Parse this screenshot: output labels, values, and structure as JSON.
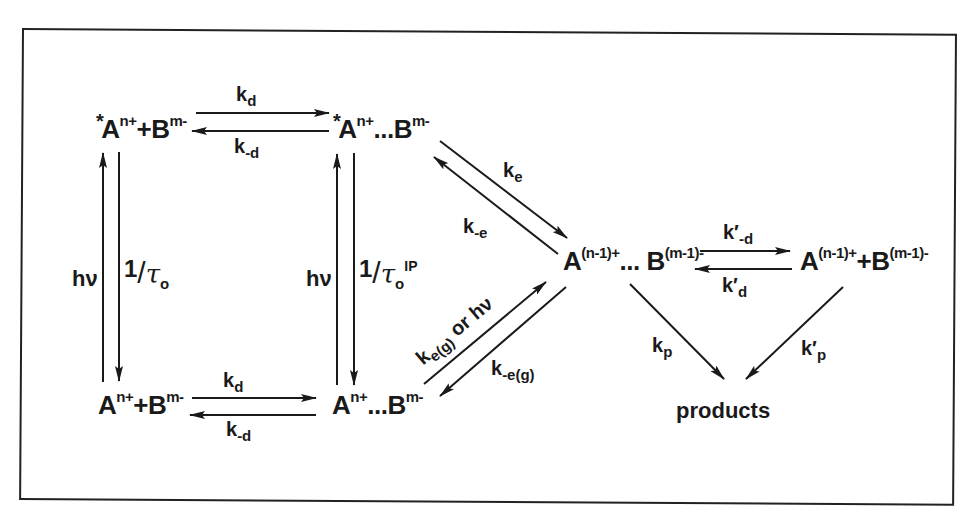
{
  "diagram": {
    "type": "reaction-scheme",
    "species": {
      "excited_free": {
        "star": "*",
        "a": "A",
        "a_charge": "n+",
        "join": "+",
        "b": "B",
        "b_charge": "m-"
      },
      "excited_pair": {
        "star": "*",
        "a": "A",
        "a_charge": "n+",
        "join": "...",
        "b": "B",
        "b_charge": "m-"
      },
      "ground_free": {
        "a": "A",
        "a_charge": "n+",
        "join": "+",
        "b": "B",
        "b_charge": "m-"
      },
      "ground_pair": {
        "a": "A",
        "a_charge": "n+",
        "join": "...",
        "b": "B",
        "b_charge": "m-"
      },
      "et_pair": {
        "a": "A",
        "a_charge": "(n-1)+",
        "join": "...",
        "b": "B",
        "b_charge": "(m-1)-"
      },
      "et_free": {
        "a": "A",
        "a_charge": "(n-1)+",
        "join": "+",
        "b": "B",
        "b_charge": "(m-1)-"
      },
      "products": "products"
    },
    "rate_labels": {
      "kd_top": {
        "k": "k",
        "sub": "d"
      },
      "k_minus_d_top": {
        "k": "k",
        "sub": "-d"
      },
      "kd_bottom": {
        "k": "k",
        "sub": "d"
      },
      "k_minus_d_bottom": {
        "k": "k",
        "sub": "-d"
      },
      "hv_left": "hν",
      "tau_left": {
        "one": "1",
        "slash": "/",
        "tau": "τ",
        "sub": "o",
        "sup": ""
      },
      "hv_middle": "hν",
      "tau_middle": {
        "one": "1",
        "slash": "/",
        "tau": "τ",
        "sub": "o",
        "sup": "IP"
      },
      "ke": {
        "k": "k",
        "sub": "e"
      },
      "k_minus_e": {
        "k": "k",
        "sub": "-e"
      },
      "ke_g_or_hv": {
        "k": "k",
        "sub": "e(g)",
        "rest": " or hν"
      },
      "k_minus_e_g": {
        "k": "k",
        "sub": "-e(g)"
      },
      "kprime_minus_d": {
        "k": "k′",
        "sub": "-d"
      },
      "kprime_d": {
        "k": "k′",
        "sub": "d"
      },
      "kp": {
        "k": "k",
        "sub": "p"
      },
      "kprime_p": {
        "k": "k′",
        "sub": "p"
      }
    },
    "colors": {
      "ink": "#1a1a1a",
      "background": "#ffffff",
      "frame": "#222222"
    }
  }
}
